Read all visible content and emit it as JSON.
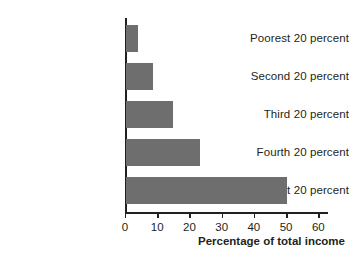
{
  "chart_data": {
    "type": "bar",
    "orientation": "horizontal",
    "title": "",
    "xlabel": "Percentage of total income",
    "ylabel": "",
    "categories": [
      "Poorest 20 percent",
      "Second 20 percent",
      "Third 20 percent",
      "Fourth 20 percent",
      "Richest 20 percent"
    ],
    "values": [
      3.6,
      8.5,
      14.5,
      23.0,
      50.0
    ],
    "xlim": [
      0,
      63
    ],
    "xticks": [
      0,
      10,
      20,
      30,
      40,
      50,
      60
    ],
    "xtick_labels": [
      "0",
      "10",
      "20",
      "30",
      "40",
      "50",
      "60"
    ],
    "grid": false,
    "legend": false,
    "bar_color": "#6e6e6e",
    "axis_color": "#231f20"
  }
}
